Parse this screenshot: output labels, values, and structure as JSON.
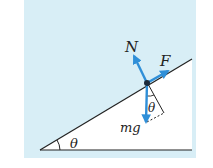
{
  "diagram": {
    "labels": {
      "normal_force": "N",
      "applied_force": "F",
      "weight": "mg",
      "incline_angle": "θ",
      "weight_angle": "θ"
    },
    "colors": {
      "panel_bg": "#d8eef6",
      "incline_fill": "#ffffff",
      "force_arrow": "#2f8fd8",
      "line": "#222222",
      "point": "#1c2a3a"
    }
  }
}
